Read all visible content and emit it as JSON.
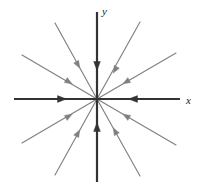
{
  "figure": {
    "background_color": "#ffffff",
    "width": 197,
    "height": 192
  },
  "axes": {
    "origin": {
      "x": 97,
      "y": 99
    },
    "axis_color": "#333333",
    "axis_stroke_width": 2.2,
    "x_label": "x",
    "y_label": "y",
    "x_label_pos": {
      "x": 186,
      "y": 104
    },
    "y_label_pos": {
      "x": 102,
      "y": 15
    },
    "x_axis": {
      "x1": 14,
      "y1": 99,
      "x2": 180,
      "y2": 99
    },
    "y_axis": {
      "x1": 97,
      "y1": 12,
      "x2": 97,
      "y2": 182
    }
  },
  "chart_data": {
    "type": "scatter",
    "xlabel": "x",
    "ylabel": "y",
    "grid": false,
    "legend": false,
    "equilibrium": {
      "x": 0,
      "y": 0,
      "classification": "stable node (sink)"
    },
    "trajectory_count": 12,
    "trajectories": [
      {
        "name": "positive-x-axis",
        "style": "axis",
        "color": "#333333",
        "angle_deg": 0,
        "start": {
          "x": 180,
          "y": 99
        },
        "end": {
          "x": 97,
          "y": 99
        },
        "arrow_at": {
          "x": 133,
          "y": 99
        },
        "arrow_dir": "left"
      },
      {
        "name": "negative-x-axis",
        "style": "axis",
        "color": "#333333",
        "angle_deg": 180,
        "start": {
          "x": 14,
          "y": 99
        },
        "end": {
          "x": 97,
          "y": 99
        },
        "arrow_at": {
          "x": 62,
          "y": 99
        },
        "arrow_dir": "right"
      },
      {
        "name": "positive-y-axis",
        "style": "axis",
        "color": "#333333",
        "angle_deg": 90,
        "start": {
          "x": 97,
          "y": 12
        },
        "end": {
          "x": 97,
          "y": 99
        },
        "arrow_at": {
          "x": 97,
          "y": 66
        },
        "arrow_dir": "down"
      },
      {
        "name": "negative-y-axis",
        "style": "axis",
        "color": "#333333",
        "angle_deg": 270,
        "start": {
          "x": 97,
          "y": 182
        },
        "end": {
          "x": 97,
          "y": 99
        },
        "arrow_at": {
          "x": 97,
          "y": 127
        },
        "arrow_dir": "up"
      },
      {
        "name": "ray-q1-steep",
        "style": "diagonal",
        "color": "#808080",
        "angle_deg": 62,
        "start": {
          "x": 140,
          "y": 22
        },
        "end": {
          "x": 97,
          "y": 99
        },
        "arrow_at": {
          "x": 115,
          "y": 70
        },
        "arrow_dir": "toward-origin"
      },
      {
        "name": "ray-q1-shallow",
        "style": "diagonal",
        "color": "#808080",
        "angle_deg": 28,
        "start": {
          "x": 176,
          "y": 53
        },
        "end": {
          "x": 97,
          "y": 99
        },
        "arrow_at": {
          "x": 126,
          "y": 82
        },
        "arrow_dir": "toward-origin"
      },
      {
        "name": "ray-q2-steep",
        "style": "diagonal",
        "color": "#808080",
        "angle_deg": 118,
        "start": {
          "x": 55,
          "y": 23
        },
        "end": {
          "x": 97,
          "y": 99
        },
        "arrow_at": {
          "x": 78,
          "y": 65
        },
        "arrow_dir": "toward-origin"
      },
      {
        "name": "ray-q2-shallow",
        "style": "diagonal",
        "color": "#808080",
        "angle_deg": 152,
        "start": {
          "x": 22,
          "y": 55
        },
        "end": {
          "x": 97,
          "y": 99
        },
        "arrow_at": {
          "x": 69,
          "y": 82
        },
        "arrow_dir": "toward-origin"
      },
      {
        "name": "ray-q3-shallow",
        "style": "diagonal",
        "color": "#808080",
        "angle_deg": 208,
        "start": {
          "x": 22,
          "y": 143
        },
        "end": {
          "x": 97,
          "y": 99
        },
        "arrow_at": {
          "x": 69,
          "y": 116
        },
        "arrow_dir": "toward-origin"
      },
      {
        "name": "ray-q3-steep",
        "style": "diagonal",
        "color": "#808080",
        "angle_deg": 242,
        "start": {
          "x": 55,
          "y": 175
        },
        "end": {
          "x": 97,
          "y": 99
        },
        "arrow_at": {
          "x": 78,
          "y": 133
        },
        "arrow_dir": "toward-origin"
      },
      {
        "name": "ray-q4-steep",
        "style": "diagonal",
        "color": "#808080",
        "angle_deg": 298,
        "start": {
          "x": 140,
          "y": 176
        },
        "end": {
          "x": 97,
          "y": 99
        },
        "arrow_at": {
          "x": 115,
          "y": 131
        },
        "arrow_dir": "toward-origin"
      },
      {
        "name": "ray-q4-shallow",
        "style": "diagonal",
        "color": "#808080",
        "angle_deg": 332,
        "start": {
          "x": 176,
          "y": 145
        },
        "end": {
          "x": 97,
          "y": 99
        },
        "arrow_at": {
          "x": 126,
          "y": 116
        },
        "arrow_dir": "toward-origin"
      }
    ]
  }
}
